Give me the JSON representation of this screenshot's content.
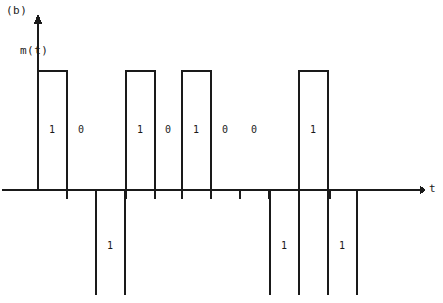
{
  "figure": {
    "panel_tag": "(b)",
    "y_axis_label": "m(t)",
    "x_axis_label": "t"
  },
  "chart_data": {
    "type": "line",
    "title": "(b)",
    "xlabel": "t",
    "ylabel": "m(t)",
    "grid": false,
    "legend": false,
    "bit_sequence": [
      "1",
      "0",
      "1",
      "0",
      "1",
      "0",
      "0",
      "1",
      "1",
      "1",
      "1"
    ],
    "levels": [
      1,
      0,
      -1,
      0,
      1,
      0,
      0,
      1,
      -1,
      1,
      -1
    ],
    "ylim": [
      -1,
      1
    ],
    "baseline_y": 190,
    "positive_top_y": 71,
    "negative_bottom_y": 295,
    "axis_x_start": 38,
    "axis_x_end": 420,
    "arrow_top_y": 14,
    "pulses": [
      {
        "label": "1",
        "polarity": "positive",
        "x_start": 38,
        "x_end": 67
      },
      {
        "label": "1",
        "polarity": "negative",
        "x_start": 96,
        "x_end": 125
      },
      {
        "label": "1",
        "polarity": "positive",
        "x_start": 126,
        "x_end": 155
      },
      {
        "label": "1",
        "polarity": "positive",
        "x_start": 182,
        "x_end": 211
      },
      {
        "label": "1",
        "polarity": "negative",
        "x_start": 270,
        "x_end": 299
      },
      {
        "label": "1",
        "polarity": "positive",
        "x_start": 299,
        "x_end": 328
      },
      {
        "label": "1",
        "polarity": "negative",
        "x_start": 328,
        "x_end": 357
      }
    ],
    "upper_bit_labels": [
      {
        "text": "1",
        "x": 52,
        "y": 124
      },
      {
        "text": "0",
        "x": 81,
        "y": 124
      },
      {
        "text": "1",
        "x": 140,
        "y": 124
      },
      {
        "text": "0",
        "x": 168,
        "y": 124
      },
      {
        "text": "1",
        "x": 196,
        "y": 124
      },
      {
        "text": "0",
        "x": 225,
        "y": 124
      },
      {
        "text": "0",
        "x": 254,
        "y": 124
      },
      {
        "text": "1",
        "x": 313,
        "y": 124
      }
    ],
    "lower_bit_labels": [
      {
        "text": "1",
        "x": 110,
        "y": 240
      },
      {
        "text": "1",
        "x": 284,
        "y": 240
      },
      {
        "text": "1",
        "x": 342,
        "y": 240
      }
    ],
    "tick_positions": [
      67,
      96,
      125,
      126,
      155,
      182,
      211,
      240,
      269,
      270,
      299,
      328,
      330,
      357
    ],
    "tick_length": 9
  }
}
